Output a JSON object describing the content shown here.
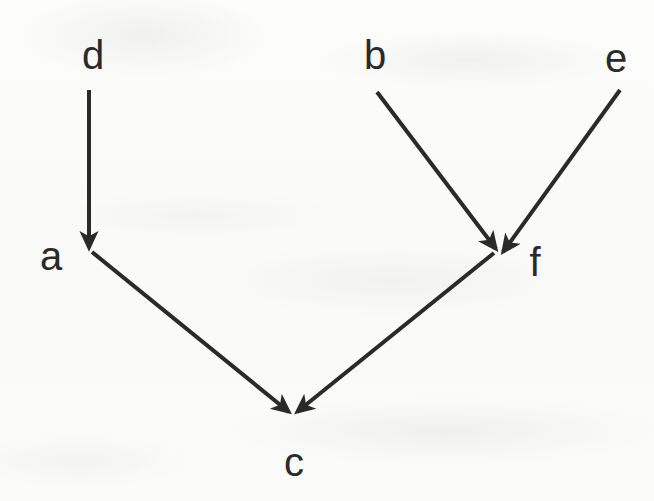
{
  "figure": {
    "kind": "directed-graph",
    "title": "",
    "background_color": "#fbfbfa",
    "ink_color": "#2a2a2a",
    "stroke_width": 4
  },
  "nodes": [
    {
      "id": "d",
      "label": "d",
      "x": 93,
      "y": 55
    },
    {
      "id": "b",
      "label": "b",
      "x": 375,
      "y": 55
    },
    {
      "id": "e",
      "label": "e",
      "x": 616,
      "y": 58
    },
    {
      "id": "a",
      "label": "a",
      "x": 51,
      "y": 256
    },
    {
      "id": "f",
      "label": "f",
      "x": 535,
      "y": 262
    },
    {
      "id": "c",
      "label": "c",
      "x": 294,
      "y": 462
    }
  ],
  "edges": [
    {
      "id": "d-to-a",
      "from": "d",
      "to": "a",
      "x1": 89,
      "y1": 90,
      "x2": 89,
      "y2": 248,
      "arrowhead": true
    },
    {
      "id": "a-to-c",
      "from": "a",
      "to": "c",
      "x1": 92,
      "y1": 252,
      "x2": 289,
      "y2": 412,
      "arrowhead": true
    },
    {
      "id": "b-to-f",
      "from": "b",
      "to": "f",
      "x1": 377,
      "y1": 92,
      "x2": 496,
      "y2": 249,
      "arrowhead": true
    },
    {
      "id": "e-to-f",
      "from": "e",
      "to": "f",
      "x1": 620,
      "y1": 90,
      "x2": 503,
      "y2": 252,
      "arrowhead": true
    },
    {
      "id": "f-to-c",
      "from": "f",
      "to": "c",
      "x1": 494,
      "y1": 253,
      "x2": 297,
      "y2": 412,
      "arrowhead": true
    }
  ]
}
